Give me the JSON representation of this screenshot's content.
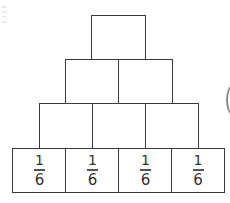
{
  "diagram": {
    "type": "fraction-pyramid",
    "rows": [
      {
        "row": 1,
        "cells": [
          {
            "value": ""
          }
        ]
      },
      {
        "row": 2,
        "cells": [
          {
            "value": ""
          },
          {
            "value": ""
          }
        ]
      },
      {
        "row": 3,
        "cells": [
          {
            "value": ""
          },
          {
            "value": ""
          },
          {
            "value": ""
          }
        ]
      },
      {
        "row": 4,
        "cells": [
          {
            "numerator": "1",
            "denominator": "6"
          },
          {
            "numerator": "1",
            "denominator": "6"
          },
          {
            "numerator": "1",
            "denominator": "6"
          },
          {
            "numerator": "1",
            "denominator": "6"
          }
        ]
      }
    ],
    "colors": {
      "border": "#3a3a3a",
      "text": "#333333",
      "background": "#ffffff"
    }
  }
}
